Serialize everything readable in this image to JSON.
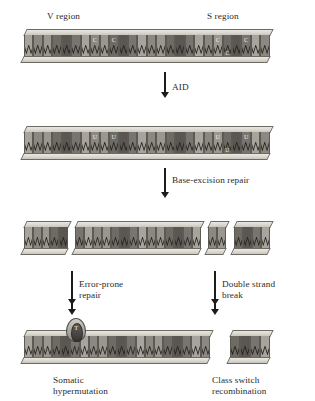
{
  "figure": {
    "region_labels": [
      {
        "text": "V region",
        "x": 47,
        "y": 11
      },
      {
        "text": "S region",
        "x": 207,
        "y": 11
      }
    ],
    "step_labels": [
      {
        "text": "AID",
        "x": 172,
        "y": 82,
        "lines": [
          "AID"
        ]
      },
      {
        "text": "Base-excision repair",
        "x": 172,
        "y": 175,
        "lines": [
          "Base-excision repair"
        ]
      },
      {
        "text": "Error-prone repair",
        "x": 79,
        "y": 279,
        "lines": [
          "Error-prone",
          "repair"
        ]
      },
      {
        "text": "Double strand break",
        "x": 222,
        "y": 279,
        "lines": [
          "Double strand",
          "break"
        ]
      },
      {
        "text": "Somatic hypermutation",
        "x": 53,
        "y": 375,
        "lines": [
          "Somatic",
          "hypermutation"
        ]
      },
      {
        "text": "Class switch recombination",
        "x": 212,
        "y": 375,
        "lines": [
          "Class switch",
          "recombination"
        ]
      }
    ],
    "arrows": [
      {
        "name": "aid-arrow",
        "x": 164,
        "y": 72,
        "length": 26
      },
      {
        "name": "base-excision-arrow",
        "x": 164,
        "y": 168,
        "length": 30
      },
      {
        "name": "error-prone-arrow",
        "x": 71,
        "y": 271,
        "length": 34
      },
      {
        "name": "double-strand-break-arrow",
        "x": 214,
        "y": 271,
        "length": 34
      },
      {
        "name": "somatic-hypermutation-arrow",
        "x": 71,
        "y": 300,
        "length": 15
      },
      {
        "name": "class-switch-arrow",
        "x": 214,
        "y": 300,
        "length": 15
      }
    ],
    "base_letters": {
      "cytosine": "C",
      "uracil": "U",
      "mutation": "T"
    },
    "colors": {
      "rail_light": "#e9e7e2",
      "rail_dark": "#c9c6bd",
      "outline": "#5d5a54",
      "arrow": "#1c1c1c",
      "text": "#2b2b2b",
      "base_shades": [
        "#8b8881",
        "#6e6b65",
        "#a7a49d",
        "#5a5752",
        "#9a978f",
        "#787570"
      ]
    },
    "strands": [
      {
        "name": "strand-germline",
        "caption": "Germline V and S regions with cytosines",
        "y": 29,
        "segments": [
          {
            "x": 22,
            "width": 250,
            "bases": 26,
            "shades": [
              2,
              0,
              4,
              1,
              3,
              5,
              2,
              0,
              4,
              1,
              3,
              5,
              2,
              0,
              4,
              1,
              3,
              5,
              2,
              0,
              4,
              1,
              3,
              5,
              2,
              0
            ],
            "letters": [
              {
                "index": 7,
                "text": "C",
                "pos": "top"
              },
              {
                "index": 9,
                "text": "C",
                "pos": "top"
              },
              {
                "index": 20,
                "text": "C",
                "pos": "top"
              },
              {
                "index": 21,
                "text": "C",
                "pos": "bot"
              },
              {
                "index": 23,
                "text": "C",
                "pos": "top"
              }
            ]
          }
        ]
      },
      {
        "name": "strand-deaminated",
        "caption": "Cytosines deaminated to uracil by AID",
        "y": 126,
        "segments": [
          {
            "x": 22,
            "width": 250,
            "bases": 26,
            "shades": [
              2,
              0,
              4,
              1,
              3,
              5,
              2,
              0,
              4,
              1,
              3,
              5,
              2,
              0,
              4,
              1,
              3,
              5,
              2,
              0,
              4,
              1,
              3,
              5,
              2,
              0
            ],
            "letters": [
              {
                "index": 7,
                "text": "U",
                "pos": "top"
              },
              {
                "index": 9,
                "text": "U",
                "pos": "top"
              },
              {
                "index": 20,
                "text": "U",
                "pos": "top"
              },
              {
                "index": 21,
                "text": "U",
                "pos": "bot"
              },
              {
                "index": 23,
                "text": "U",
                "pos": "top"
              }
            ]
          }
        ]
      },
      {
        "name": "strand-nicked",
        "caption": "Abasic sites nicked, producing gaps and a double-strand break",
        "y": 221,
        "segments": [
          {
            "x": 22,
            "width": 48,
            "bases": 5,
            "shades": [
              2,
              0,
              4,
              1,
              3
            ],
            "letters": []
          },
          {
            "x": 73,
            "width": 130,
            "bases": 14,
            "shades": [
              5,
              2,
              0,
              4,
              1,
              3,
              5,
              2,
              0,
              4,
              1,
              3,
              5,
              2
            ],
            "letters": []
          },
          {
            "x": 206,
            "width": 22,
            "bases": 2,
            "shades": [
              0,
              4
            ],
            "letters": [],
            "break_after": true
          },
          {
            "x": 232,
            "width": 40,
            "bases": 4,
            "shades": [
              1,
              3,
              5,
              2
            ],
            "letters": []
          }
        ]
      },
      {
        "name": "strand-resolved",
        "caption": "Mutated V region and recombined switch region",
        "y": 330,
        "segments": [
          {
            "x": 22,
            "width": 190,
            "bases": 20,
            "shades": [
              2,
              0,
              4,
              1,
              3,
              5,
              2,
              0,
              4,
              1,
              3,
              5,
              2,
              0,
              4,
              1,
              3,
              5,
              2,
              0
            ],
            "letters": [],
            "bubble": {
              "index": 5,
              "letter": "T"
            }
          },
          {
            "x": 228,
            "width": 44,
            "bases": 4,
            "shades": [
              1,
              3,
              5,
              2
            ],
            "letters": []
          }
        ]
      }
    ]
  }
}
